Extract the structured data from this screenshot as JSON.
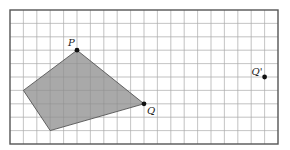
{
  "grid": {
    "columns": 20,
    "rows": 10,
    "origin_px": [
      10,
      10
    ],
    "cell_px": 13.4,
    "line_color": "#c8c8c8",
    "border_color": "#555555"
  },
  "polygon": {
    "vertices_grid": [
      [
        5,
        3
      ],
      [
        10,
        7
      ],
      [
        3,
        9
      ],
      [
        1,
        6
      ]
    ],
    "fill": "#9a9a9a",
    "stroke": "#444444"
  },
  "points": [
    {
      "label": "P",
      "grid": [
        5,
        3
      ],
      "label_offset": [
        -9,
        -4
      ]
    },
    {
      "label": "Q",
      "grid": [
        10,
        7
      ],
      "label_offset": [
        3,
        10
      ]
    },
    {
      "label": "Q'",
      "grid": [
        19,
        5
      ],
      "label_offset": [
        -13,
        -2
      ]
    }
  ]
}
